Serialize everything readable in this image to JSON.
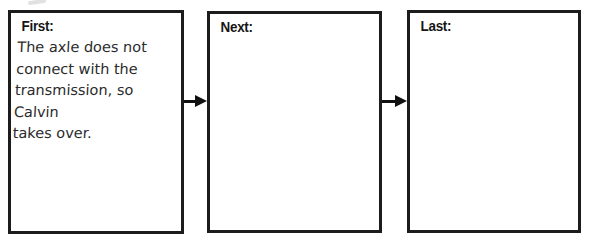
{
  "diagram": {
    "type": "sequence-graphic-organizer",
    "colors": {
      "background": "#ffffff",
      "box_border": "#1c1c1c",
      "label_text": "#161616",
      "handwriting_text": "#2b2b2b",
      "arrow": "#111111"
    },
    "boxes": [
      {
        "id": "first",
        "label": "First:",
        "content": "The axle does not\nconnect with the\ntransmission, so Calvin\ntakes over."
      },
      {
        "id": "next",
        "label": "Next:",
        "content": ""
      },
      {
        "id": "last",
        "label": "Last:",
        "content": ""
      }
    ],
    "arrows": [
      {
        "from": "first",
        "to": "next",
        "direction": "right"
      },
      {
        "from": "next",
        "to": "last",
        "direction": "right"
      }
    ]
  }
}
